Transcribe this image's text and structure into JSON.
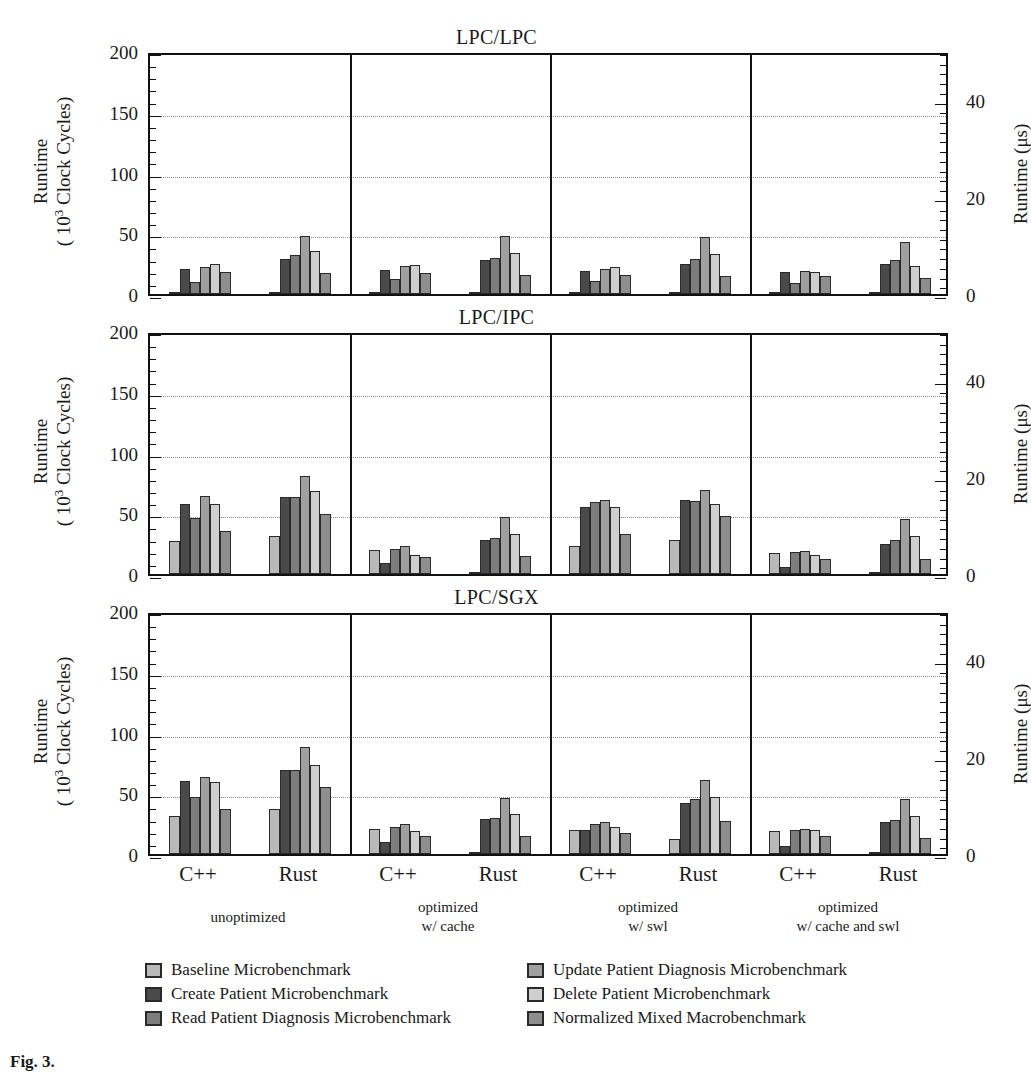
{
  "figure": {
    "caption": "Fig. 3.",
    "series_colors": [
      "#b9b9b9",
      "#4a4a4a",
      "#7d7d7d",
      "#a0a0a0",
      "#cfcfcf",
      "#8e8e8e"
    ],
    "axis_left_title_line1": "Runtime",
    "axis_left_title_line2": "( 10³ Clock Cycles)",
    "axis_right_title": "Runtime (μs)",
    "yticks_left": [
      "0",
      "50",
      "100",
      "150",
      "200"
    ],
    "yticks_right": [
      "0",
      "20",
      "40"
    ],
    "lang_labels": [
      "C++",
      "Rust",
      "C++",
      "Rust",
      "C++",
      "Rust",
      "C++",
      "Rust"
    ],
    "group_labels": [
      {
        "l1": "unoptimized",
        "l2": ""
      },
      {
        "l1": "optimized",
        "l2": "w/ cache"
      },
      {
        "l1": "optimized",
        "l2": "w/ swl"
      },
      {
        "l1": "optimized",
        "l2": "w/ cache and swl"
      }
    ],
    "legend": [
      {
        "label": "Baseline Microbenchmark",
        "color": "#b9b9b9"
      },
      {
        "label": "Create Patient Microbenchmark",
        "color": "#4a4a4a"
      },
      {
        "label": "Read Patient Diagnosis Microbenchmark",
        "color": "#7d7d7d"
      },
      {
        "label": "Update Patient Diagnosis Microbenchmark",
        "color": "#a0a0a0"
      },
      {
        "label": "Delete Patient Microbenchmark",
        "color": "#cfcfcf"
      },
      {
        "label": "Normalized Mixed Macrobenchmark",
        "color": "#8e8e8e"
      }
    ]
  },
  "chart_data": [
    {
      "type": "bar",
      "title": "LPC/LPC",
      "xlabel": "",
      "ylabel": "Runtime (10^3 Clock Cycles)",
      "ylabel_right": "Runtime (μs)",
      "ylim": [
        0,
        200
      ],
      "ylim_right": [
        0,
        50
      ],
      "yticks": [
        0,
        50,
        100,
        150,
        200
      ],
      "yticks_right": [
        0,
        20,
        40
      ],
      "grid": true,
      "legend_position": "bottom",
      "categories": [
        "unoptimized / C++",
        "unoptimized / Rust",
        "optimized w/ cache / C++",
        "optimized w/ cache / Rust",
        "optimized w/ swl / C++",
        "optimized w/ swl / Rust",
        "optimized w/ cache and swl / C++",
        "optimized w/ cache and swl / Rust"
      ],
      "series": [
        {
          "name": "Baseline Microbenchmark",
          "values": [
            1,
            2,
            1,
            1,
            1,
            1,
            1,
            1
          ]
        },
        {
          "name": "Create Patient Microbenchmark",
          "values": [
            21,
            29,
            20,
            28,
            19,
            25,
            18,
            25
          ]
        },
        {
          "name": "Read Patient Diagnosis Microbenchmark",
          "values": [
            10,
            32,
            12,
            30,
            11,
            29,
            9,
            28
          ]
        },
        {
          "name": "Update Patient Diagnosis Microbenchmark",
          "values": [
            22,
            48,
            23,
            48,
            21,
            47,
            19,
            43
          ]
        },
        {
          "name": "Delete Patient Microbenchmark",
          "values": [
            25,
            35,
            24,
            34,
            22,
            33,
            18,
            23
          ]
        },
        {
          "name": "Normalized Mixed Macrobenchmark",
          "values": [
            18,
            17,
            17,
            16,
            16,
            15,
            15,
            13
          ]
        }
      ]
    },
    {
      "type": "bar",
      "title": "LPC/IPC",
      "xlabel": "",
      "ylabel": "Runtime (10^3 Clock Cycles)",
      "ylabel_right": "Runtime (μs)",
      "ylim": [
        0,
        200
      ],
      "ylim_right": [
        0,
        50
      ],
      "yticks": [
        0,
        50,
        100,
        150,
        200
      ],
      "yticks_right": [
        0,
        20,
        40
      ],
      "grid": true,
      "legend_position": "bottom",
      "categories": [
        "unoptimized / C++",
        "unoptimized / Rust",
        "optimized w/ cache / C++",
        "optimized w/ cache / Rust",
        "optimized w/ swl / C++",
        "optimized w/ swl / Rust",
        "optimized w/ cache and swl / C++",
        "optimized w/ cache and swl / Rust"
      ],
      "series": [
        {
          "name": "Baseline Microbenchmark",
          "values": [
            27,
            31,
            20,
            2,
            23,
            28,
            17,
            2
          ]
        },
        {
          "name": "Create Patient Microbenchmark",
          "values": [
            58,
            63,
            9,
            28,
            55,
            61,
            6,
            25
          ]
        },
        {
          "name": "Read Patient Diagnosis Microbenchmark",
          "values": [
            46,
            63,
            21,
            30,
            59,
            60,
            18,
            28
          ]
        },
        {
          "name": "Update Patient Diagnosis Microbenchmark",
          "values": [
            64,
            81,
            23,
            47,
            61,
            69,
            19,
            45
          ]
        },
        {
          "name": "Delete Patient Microbenchmark",
          "values": [
            58,
            68,
            16,
            33,
            55,
            58,
            16,
            31
          ]
        },
        {
          "name": "Normalized Mixed Macrobenchmark",
          "values": [
            35,
            49,
            14,
            15,
            33,
            48,
            12,
            12
          ]
        }
      ]
    },
    {
      "type": "bar",
      "title": "LPC/SGX",
      "xlabel": "",
      "ylabel": "Runtime (10^3 Clock Cycles)",
      "ylabel_right": "Runtime (μs)",
      "ylim": [
        0,
        200
      ],
      "ylim_right": [
        0,
        50
      ],
      "yticks": [
        0,
        50,
        100,
        150,
        200
      ],
      "yticks_right": [
        0,
        20,
        40
      ],
      "grid": true,
      "legend_position": "bottom",
      "categories": [
        "unoptimized / C++",
        "unoptimized / Rust",
        "optimized w/ cache / C++",
        "optimized w/ cache / Rust",
        "optimized w/ swl / C++",
        "optimized w/ swl / Rust",
        "optimized w/ cache and swl / C++",
        "optimized w/ cache and swl / Rust"
      ],
      "series": [
        {
          "name": "Baseline Microbenchmark",
          "values": [
            31,
            37,
            21,
            2,
            20,
            12,
            19,
            2
          ]
        },
        {
          "name": "Create Patient Microbenchmark",
          "values": [
            60,
            69,
            10,
            29,
            20,
            42,
            7,
            26
          ]
        },
        {
          "name": "Read Patient Diagnosis Microbenchmark",
          "values": [
            47,
            69,
            22,
            30,
            25,
            45,
            20,
            28
          ]
        },
        {
          "name": "Update Patient Diagnosis Microbenchmark",
          "values": [
            63,
            88,
            25,
            46,
            26,
            61,
            21,
            45
          ]
        },
        {
          "name": "Delete Patient Microbenchmark",
          "values": [
            59,
            73,
            19,
            33,
            22,
            47,
            20,
            31
          ]
        },
        {
          "name": "Normalized Mixed Macrobenchmark",
          "values": [
            37,
            55,
            15,
            15,
            17,
            27,
            15,
            13
          ]
        }
      ]
    }
  ]
}
